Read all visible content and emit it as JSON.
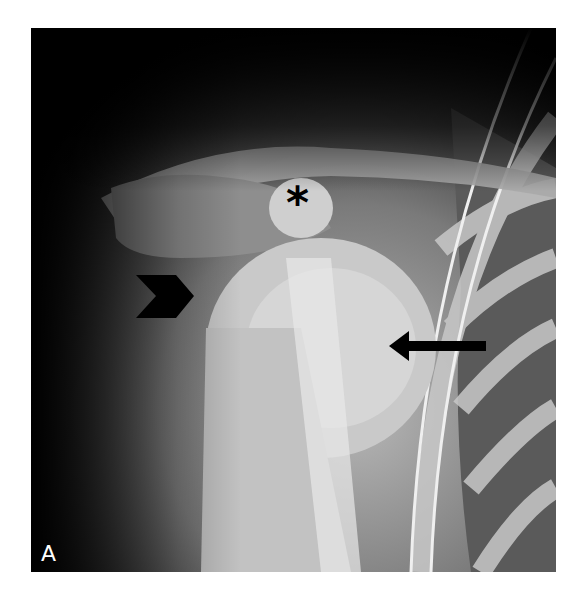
{
  "figure": {
    "panel_label": "A",
    "annotations": [
      {
        "type": "asterisk",
        "symbol": "*",
        "x": 286,
        "y": 202
      },
      {
        "type": "arrowhead",
        "x": 170,
        "y": 294,
        "direction": "right"
      },
      {
        "type": "arrow",
        "x": 440,
        "y": 345,
        "direction": "left"
      }
    ]
  }
}
